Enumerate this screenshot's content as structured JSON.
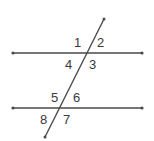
{
  "diagram": {
    "colors": {
      "line": "#4a4a4a",
      "label": "#3a3a3a",
      "background": "#ffffff"
    },
    "parallel_lines": [
      {
        "name": "upper",
        "x1": 12,
        "x2": 143,
        "y": 53
      },
      {
        "name": "lower",
        "x1": 12,
        "x2": 143,
        "y": 108
      }
    ],
    "transversal": {
      "x1": 104,
      "y1": 19,
      "x2": 45,
      "y2": 137
    },
    "angles": {
      "a1": "1",
      "a2": "2",
      "a3": "3",
      "a4": "4",
      "a5": "5",
      "a6": "6",
      "a7": "7",
      "a8": "8"
    }
  }
}
